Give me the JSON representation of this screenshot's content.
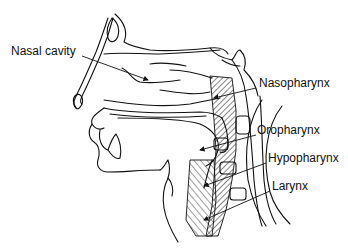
{
  "diagram": {
    "labels": [
      {
        "id": "nasal-cavity",
        "text": "Nasal cavity",
        "x": 11,
        "y": 50
      },
      {
        "id": "nasopharynx",
        "text": "Nasopharynx",
        "x": 259,
        "y": 82
      },
      {
        "id": "oropharynx",
        "text": "Oropharynx",
        "x": 257,
        "y": 129
      },
      {
        "id": "hypopharynx",
        "text": "Hypopharynx",
        "x": 268,
        "y": 157
      },
      {
        "id": "larynx",
        "text": "Larynx",
        "x": 272,
        "y": 185
      }
    ],
    "colors": {
      "line": "#111111",
      "background": "#ffffff"
    }
  }
}
